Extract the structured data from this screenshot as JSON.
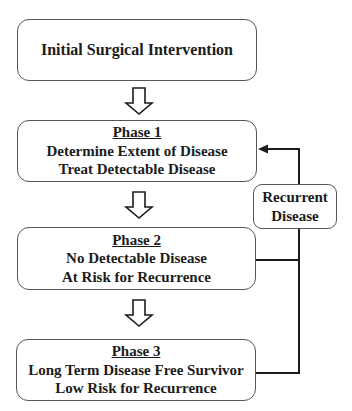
{
  "diagram": {
    "start": {
      "label": "Initial Surgical Intervention"
    },
    "phases": [
      {
        "title": "Phase 1",
        "lines": [
          "Determine Extent of Disease",
          "Treat Detectable Disease"
        ]
      },
      {
        "title": "Phase 2",
        "lines": [
          "No Detectable Disease",
          "At Risk for Recurrence"
        ]
      },
      {
        "title": "Phase 3",
        "lines": [
          "Long Term Disease Free Survivor",
          "Low Risk for Recurrence"
        ]
      }
    ],
    "feedback": {
      "label_line1": "Recurrent",
      "label_line2": "Disease"
    },
    "colors": {
      "line": "#1c1c1c",
      "border": "#555555"
    }
  }
}
